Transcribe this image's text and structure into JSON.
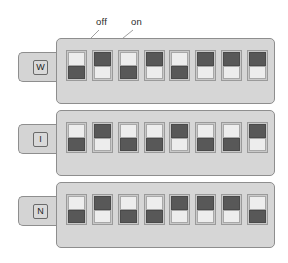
{
  "figure": {
    "annotations": [
      {
        "id": "off",
        "label": "off"
      },
      {
        "id": "on",
        "label": "on"
      }
    ],
    "states": {
      "off_label": "off",
      "on_label": "on"
    },
    "colors": {
      "panel": "#d6d6d6",
      "panel_border": "#8e8e8e",
      "tab": "#d4d4d4",
      "switch_body": "#c9c9c9",
      "actuator_dark": "#585858",
      "actuator_light": "#ededed",
      "leader_line": "#a0a0a0",
      "text": "#2b2b2b",
      "background": "#ffffff"
    },
    "banks": [
      {
        "tab_label": "W",
        "switch_count": 8,
        "switches": [
          {
            "index": 1,
            "state": "off"
          },
          {
            "index": 2,
            "state": "on"
          },
          {
            "index": 3,
            "state": "off"
          },
          {
            "index": 4,
            "state": "on"
          },
          {
            "index": 5,
            "state": "off"
          },
          {
            "index": 6,
            "state": "on"
          },
          {
            "index": 7,
            "state": "on"
          },
          {
            "index": 8,
            "state": "on"
          }
        ]
      },
      {
        "tab_label": "I",
        "switch_count": 8,
        "switches": [
          {
            "index": 1,
            "state": "off"
          },
          {
            "index": 2,
            "state": "on"
          },
          {
            "index": 3,
            "state": "off"
          },
          {
            "index": 4,
            "state": "off"
          },
          {
            "index": 5,
            "state": "on"
          },
          {
            "index": 6,
            "state": "off"
          },
          {
            "index": 7,
            "state": "off"
          },
          {
            "index": 8,
            "state": "on"
          }
        ]
      },
      {
        "tab_label": "N",
        "switch_count": 8,
        "switches": [
          {
            "index": 1,
            "state": "off"
          },
          {
            "index": 2,
            "state": "on"
          },
          {
            "index": 3,
            "state": "off"
          },
          {
            "index": 4,
            "state": "off"
          },
          {
            "index": 5,
            "state": "on"
          },
          {
            "index": 6,
            "state": "on"
          },
          {
            "index": 7,
            "state": "on"
          },
          {
            "index": 8,
            "state": "off"
          }
        ]
      }
    ]
  }
}
